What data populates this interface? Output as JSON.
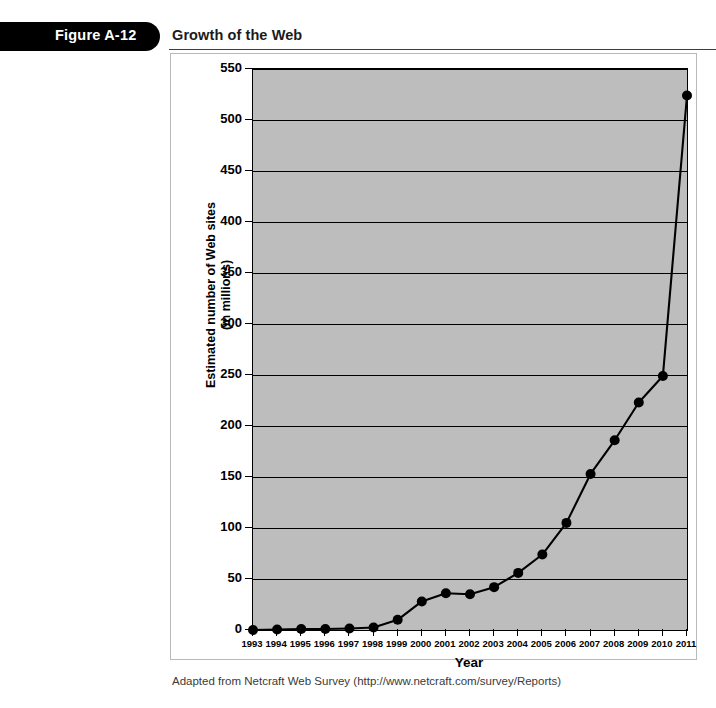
{
  "header": {
    "figure_number": "Figure A-12",
    "title": "Growth of the Web"
  },
  "source_note": "Adapted from Netcraft Web Survey (http://www.netcraft.com/survey/Reports)",
  "colors": {
    "plot_background": "#bdbdbd",
    "axis": "#000000",
    "series_line": "#000000",
    "marker": "#000000",
    "banner": "#000000",
    "banner_text": "#ffffff",
    "page_background": "#ffffff"
  },
  "chart_data": {
    "type": "line",
    "title": "Growth of the Web",
    "xlabel": "Year",
    "ylabel": "Estimated number of Web sites\n(in millions)",
    "ylabel_line1": "Estimated number of Web sites",
    "ylabel_line2": "(in millions)",
    "grid": true,
    "legend": null,
    "legend_position": "none",
    "xlim": [
      1993,
      2011
    ],
    "ylim": [
      0,
      550
    ],
    "ytick_step": 50,
    "yticks": [
      0,
      50,
      100,
      150,
      200,
      250,
      300,
      350,
      400,
      450,
      500,
      550
    ],
    "ytick_labels": [
      "0",
      "50",
      "100",
      "150",
      "200",
      "250",
      "300",
      "350",
      "400",
      "450",
      "500",
      "550"
    ],
    "categories": [
      "1993",
      "1994",
      "1995",
      "1996",
      "1997",
      "1998",
      "1999",
      "2000",
      "2001",
      "2002",
      "2003",
      "2004",
      "2005",
      "2006",
      "2007",
      "2008",
      "2009",
      "2010",
      "2011"
    ],
    "x": [
      1993,
      1994,
      1995,
      1996,
      1997,
      1998,
      1999,
      2000,
      2001,
      2002,
      2003,
      2004,
      2005,
      2006,
      2007,
      2008,
      2009,
      2010,
      2011
    ],
    "values": [
      0,
      0.5,
      1,
      1,
      1.5,
      2.5,
      10,
      28,
      36,
      35,
      42,
      56,
      74,
      105,
      153,
      186,
      223,
      249,
      524
    ],
    "series": [
      {
        "name": "Estimated number of Web sites (in millions)",
        "values": [
          0,
          0.5,
          1,
          1,
          1.5,
          2.5,
          10,
          28,
          36,
          35,
          42,
          56,
          74,
          105,
          153,
          186,
          223,
          249,
          524
        ]
      }
    ],
    "annotations": []
  }
}
